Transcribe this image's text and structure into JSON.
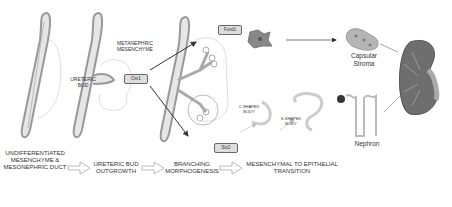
{
  "labels": {
    "metanephric_mesenchyme": "METANEPHRIC MESENCHYME",
    "ureteric_bud": "URETERIC BUD",
    "c_shaped_body": "C-SHAPED BODY",
    "s_shaped_body": "S-SHAPED BODY",
    "capsular_stroma": "Capsular Stroma",
    "nephron": "Nephron"
  },
  "gene_boxes": {
    "left": "Osr1",
    "top": "Foxd1",
    "bottom": "Six2"
  },
  "stages": [
    "UNDIFFERENTIATED MESENCHYME & MESONEPHRIC DUCT",
    "URETERIC BUD OUTGROWTH",
    "BRANCHING MORPHOGENESIS",
    "MESENCHYMAL TO EPITHELIAL TRANSITION"
  ],
  "colors": {
    "tube": "#cfcfcf",
    "tube_outline": "#999999",
    "kidney": "#6e6e6e",
    "stroma": "#b5b5b5"
  }
}
